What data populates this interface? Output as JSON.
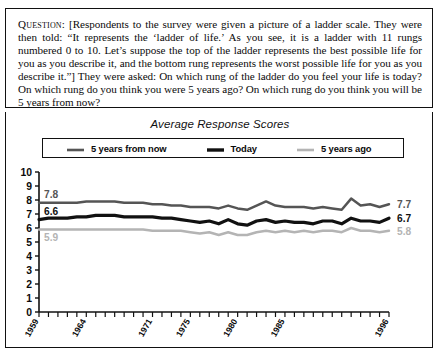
{
  "question": {
    "label": "Question:",
    "body": " [Respondents to the survey were given a picture of a ladder scale. They were then told: “It represents the ‘ladder of life.’ As you see, it is a ladder with 11 rungs numbered 0 to 10. Let’s suppose the top of the ladder represents the best possible life for you as you describe it, and the bottom rung represents the worst possible life for you as you describe it.”] They were asked: On which rung of the ladder do you feel your life is today? On which rung do you think you were 5 years ago? On which rung do you think you will be 5 years from now?"
  },
  "chart_data": {
    "type": "line",
    "title": "Average Response Scores",
    "xlabel": "",
    "ylabel": "",
    "ylim": [
      0,
      10
    ],
    "yticks": [
      "0",
      "1",
      "2",
      "3",
      "4",
      "5",
      "6",
      "7",
      "8",
      "9",
      "10"
    ],
    "grid": false,
    "legend_position": "top",
    "xtick_labels": [
      "1959",
      "1964",
      "1971",
      "1975",
      "1980",
      "1985",
      "1996"
    ],
    "xtick_indices": [
      0,
      5,
      12,
      16,
      21,
      26,
      37
    ],
    "x": [
      1959,
      1960,
      1961,
      1962,
      1963,
      1964,
      1965,
      1966,
      1967,
      1968,
      1969,
      1970,
      1971,
      1972,
      1973,
      1974,
      1975,
      1976,
      1977,
      1978,
      1979,
      1980,
      1981,
      1982,
      1983,
      1984,
      1985,
      1986,
      1987,
      1988,
      1989,
      1990,
      1991,
      1992,
      1993,
      1994,
      1995,
      1996
    ],
    "series": [
      {
        "name": "5 years from now",
        "color": "#555555",
        "start_label": "7.8",
        "end_label": "7.7",
        "values": [
          7.8,
          7.8,
          7.8,
          7.8,
          7.8,
          7.9,
          7.9,
          7.9,
          7.9,
          7.8,
          7.8,
          7.8,
          7.7,
          7.7,
          7.6,
          7.6,
          7.5,
          7.5,
          7.5,
          7.4,
          7.6,
          7.4,
          7.3,
          7.6,
          7.9,
          7.6,
          7.5,
          7.5,
          7.5,
          7.4,
          7.5,
          7.4,
          7.3,
          8.1,
          7.6,
          7.7,
          7.5,
          7.7
        ]
      },
      {
        "name": "Today",
        "color": "#111111",
        "start_label": "6.6",
        "end_label": "6.7",
        "values": [
          6.6,
          6.7,
          6.7,
          6.7,
          6.8,
          6.8,
          6.9,
          6.9,
          6.9,
          6.8,
          6.8,
          6.8,
          6.8,
          6.7,
          6.7,
          6.6,
          6.5,
          6.4,
          6.5,
          6.3,
          6.6,
          6.3,
          6.2,
          6.5,
          6.6,
          6.4,
          6.5,
          6.4,
          6.4,
          6.3,
          6.5,
          6.5,
          6.3,
          6.7,
          6.5,
          6.5,
          6.4,
          6.7
        ]
      },
      {
        "name": "5 years ago",
        "color": "#b4b4b4",
        "start_label": "5.9",
        "end_label": "5.8",
        "values": [
          5.9,
          5.9,
          5.9,
          5.9,
          5.9,
          5.9,
          5.9,
          5.9,
          5.9,
          5.9,
          5.9,
          5.9,
          5.8,
          5.8,
          5.8,
          5.8,
          5.7,
          5.6,
          5.7,
          5.5,
          5.7,
          5.5,
          5.5,
          5.7,
          5.8,
          5.7,
          5.8,
          5.7,
          5.8,
          5.7,
          5.8,
          5.8,
          5.7,
          6.0,
          5.8,
          5.8,
          5.7,
          5.8
        ]
      }
    ]
  }
}
